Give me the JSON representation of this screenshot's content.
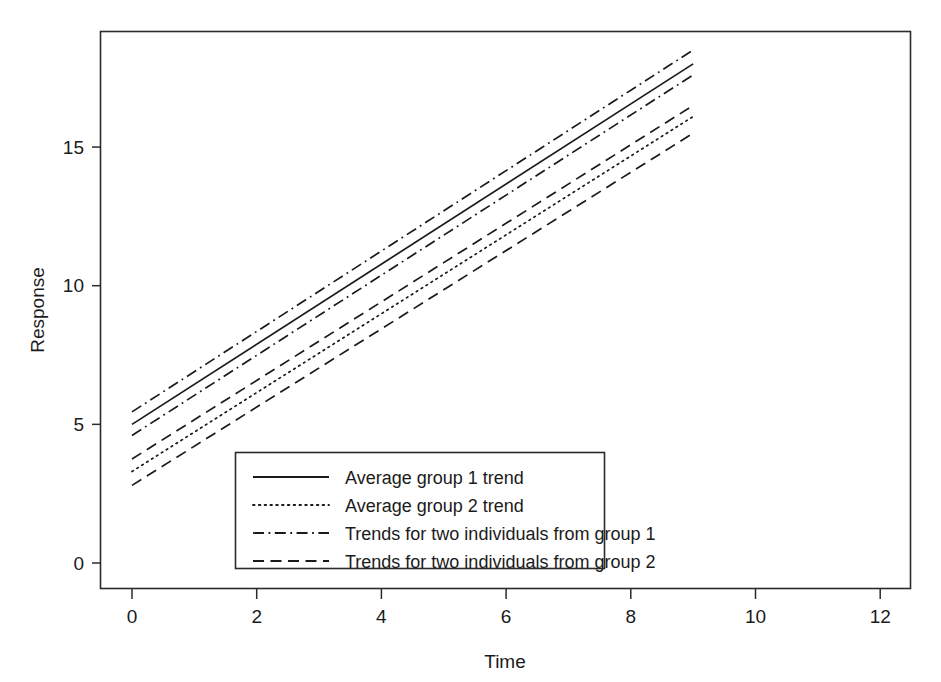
{
  "chart_data": {
    "type": "line",
    "title": "",
    "xlabel": "Time",
    "ylabel": "Response",
    "xlim": [
      -0.35,
      12.5
    ],
    "ylim": [
      -0.9,
      19.1
    ],
    "xticks": [
      0,
      2,
      4,
      6,
      8,
      10,
      12
    ],
    "xtick_labels": [
      "0",
      "2",
      "4",
      "6",
      "8",
      "10",
      "12"
    ],
    "yticks": [
      0,
      5,
      10,
      15
    ],
    "ytick_labels": [
      "0",
      "5",
      "10",
      "15"
    ],
    "grid": false,
    "legend_position": "lower center",
    "x": [
      0,
      9
    ],
    "series": [
      {
        "name": "Average group 1 trend",
        "style": "solid",
        "intercept": 5.0,
        "slope": 1.444,
        "values": [
          5.0,
          18.0
        ]
      },
      {
        "name": "Average group 2 trend",
        "style": "dotted",
        "intercept": 3.3,
        "slope": 1.422,
        "values": [
          3.3,
          16.1
        ]
      },
      {
        "name": "Trends for two individuals from group 1",
        "style": "dashdot",
        "intercept": 5.45,
        "slope": 1.45,
        "values": [
          5.45,
          18.5
        ]
      },
      {
        "name": "Trends for two individuals from group 1",
        "style": "dashdot",
        "intercept": 4.6,
        "slope": 1.444,
        "values": [
          4.6,
          17.6
        ]
      },
      {
        "name": "Trends for two individuals from group 2",
        "style": "dashed",
        "intercept": 3.75,
        "slope": 1.417,
        "values": [
          3.75,
          16.5
        ]
      },
      {
        "name": "Trends for two individuals from group 2",
        "style": "dashed",
        "intercept": 2.8,
        "slope": 1.411,
        "values": [
          2.8,
          15.5
        ]
      }
    ],
    "legend_entries": [
      {
        "label": "Average group 1 trend",
        "style": "solid"
      },
      {
        "label": "Average group 2 trend",
        "style": "dotted"
      },
      {
        "label": "Trends for two individuals from group 1",
        "style": "dashdot"
      },
      {
        "label": "Trends for two individuals from group 2",
        "style": "dashed"
      }
    ],
    "colors": {
      "line": "#1a1a1a",
      "axis": "#2b2b2b",
      "background": "#ffffff"
    }
  }
}
